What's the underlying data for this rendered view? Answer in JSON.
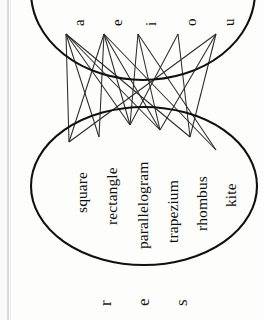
{
  "figure": {
    "kind": "mapping-diagram",
    "orientation": "rotated-90-clockwise",
    "background_color": "#fdfdfc",
    "ink_color": "#101010",
    "line_color": "#2b2b2b",
    "domain_set": {
      "name": "vowels",
      "items": [
        "a",
        "e",
        "i",
        "o",
        "u"
      ]
    },
    "codomain_set": {
      "name": "quadrilaterals",
      "items": [
        "square",
        "rectangle",
        "parallelogram",
        "trapezium",
        "rhombus",
        "kite"
      ]
    },
    "edges": [
      {
        "from": "a",
        "to": "square"
      },
      {
        "from": "a",
        "to": "rectangle"
      },
      {
        "from": "a",
        "to": "parallelogram"
      },
      {
        "from": "a",
        "to": "trapezium"
      },
      {
        "from": "a",
        "to": "rhombus"
      },
      {
        "from": "e",
        "to": "square"
      },
      {
        "from": "e",
        "to": "rectangle"
      },
      {
        "from": "e",
        "to": "parallelogram"
      },
      {
        "from": "e",
        "to": "trapezium"
      },
      {
        "from": "e",
        "to": "kite"
      },
      {
        "from": "i",
        "to": "parallelogram"
      },
      {
        "from": "i",
        "to": "trapezium"
      },
      {
        "from": "i",
        "to": "kite"
      },
      {
        "from": "o",
        "to": "parallelogram"
      },
      {
        "from": "o",
        "to": "rhombus"
      },
      {
        "from": "u",
        "to": "square"
      },
      {
        "from": "u",
        "to": "trapezium"
      },
      {
        "from": "u",
        "to": "rhombus"
      }
    ],
    "cut_off_text_bottom": [
      "r",
      "e",
      "s"
    ]
  }
}
